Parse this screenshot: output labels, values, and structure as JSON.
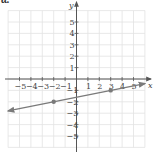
{
  "figure": {
    "part_label": "a.",
    "x_axis_label": "x",
    "y_axis_label": "y"
  },
  "colors": {
    "grid": "#e2e2e2",
    "axis": "#555555",
    "line": "#7a7a7a",
    "point": "#7a7a7a",
    "text": "#444444"
  },
  "chart_data": {
    "type": "line",
    "title": "",
    "xlabel": "x",
    "ylabel": "y",
    "xlim": [
      -6,
      6
    ],
    "ylim": [
      -6,
      6
    ],
    "grid": true,
    "x_ticks": [
      -5,
      -4,
      -3,
      -2,
      -1,
      1,
      2,
      3,
      4,
      5
    ],
    "y_ticks": [
      -5,
      -4,
      -3,
      -2,
      -1,
      1,
      2,
      3,
      4,
      5
    ],
    "x_tick_labels": [
      "−5",
      "−4",
      "−3",
      "−2",
      "−1",
      "1",
      "2",
      "3",
      "4",
      "5"
    ],
    "y_tick_labels": [
      "−5",
      "−4",
      "−3",
      "−2",
      "−1",
      "1",
      "2",
      "3",
      "4",
      "5"
    ],
    "series": [
      {
        "name": "line",
        "equation": "y = (1/5)x − 8/5",
        "slope": 0.2,
        "intercept": -1.6,
        "arrows_both_ends": true,
        "x_range": [
          -6.0,
          6.0
        ],
        "points": [
          {
            "x": -2,
            "y": -2
          },
          {
            "x": 3,
            "y": -1
          }
        ]
      }
    ]
  }
}
